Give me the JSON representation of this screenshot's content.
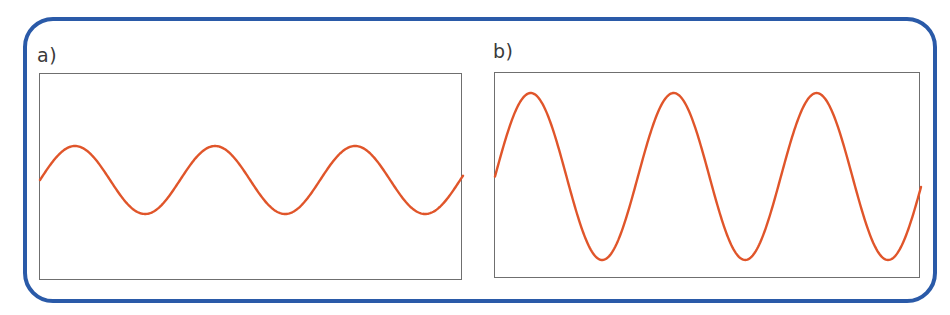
{
  "figure": {
    "frame_color": "#2a5aa8",
    "wave_color": "#e0552a",
    "box_color": "#6f6f6f"
  },
  "panels": [
    {
      "label": "a)",
      "box": {
        "x": 39,
        "y": 73,
        "w": 423,
        "h": 207
      },
      "wave": {
        "cycles": 3.02,
        "amplitude_px": 34,
        "midline_offset_px": 106,
        "phase": 0
      }
    },
    {
      "label": "b)",
      "box": {
        "x": 494,
        "y": 72,
        "w": 426,
        "h": 206
      },
      "wave": {
        "cycles": 2.98,
        "amplitude_px": 83.5,
        "midline_offset_px": 103.5,
        "phase": 0
      }
    }
  ],
  "chart_data": [
    {
      "type": "line",
      "title": "a)",
      "description": "Sine wave, small amplitude, 3 full cycles",
      "cycles": 3,
      "relative_amplitude": 1.0,
      "x": [
        0,
        0.25,
        0.5,
        0.75,
        1,
        1.25,
        1.5,
        1.75,
        2,
        2.25,
        2.5,
        2.75,
        3
      ],
      "y": [
        0,
        1,
        0,
        -1,
        0,
        1,
        0,
        -1,
        0,
        1,
        0,
        -1,
        0
      ],
      "xlabel": "",
      "ylabel": "",
      "grid": false
    },
    {
      "type": "line",
      "title": "b)",
      "description": "Sine wave, same frequency, larger amplitude (~2.5x of a), 3 full cycles",
      "cycles": 3,
      "relative_amplitude": 2.5,
      "x": [
        0,
        0.25,
        0.5,
        0.75,
        1,
        1.25,
        1.5,
        1.75,
        2,
        2.25,
        2.5,
        2.75,
        3
      ],
      "y": [
        0,
        2.5,
        0,
        -2.5,
        0,
        2.5,
        0,
        -2.5,
        0,
        2.5,
        0,
        -2.5,
        0
      ],
      "xlabel": "",
      "ylabel": "",
      "grid": false
    }
  ]
}
